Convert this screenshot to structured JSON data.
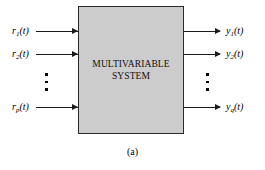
{
  "figure": {
    "caption": "(a)",
    "block": {
      "label_line1": "MULTIVARIABLE",
      "label_line2": "SYSTEM",
      "fill_color": "#cccccc",
      "border_color": "#2a2a2a"
    },
    "line_color": "#1a1a1a",
    "inputs": [
      {
        "label_base": "r",
        "label_sub": "1",
        "label_arg": "(t)"
      },
      {
        "label_base": "r",
        "label_sub": "2",
        "label_arg": "(t)"
      },
      {
        "label_base": "r",
        "label_sub": "p",
        "label_arg": "(t)"
      }
    ],
    "outputs": [
      {
        "label_base": "y",
        "label_sub": "1",
        "label_arg": "(t)"
      },
      {
        "label_base": "y",
        "label_sub": "2",
        "label_arg": "(t)"
      },
      {
        "label_base": "y",
        "label_sub": "q",
        "label_arg": "(t)"
      }
    ],
    "ellipsis": {
      "left_name": "input-vertical-ellipsis",
      "right_name": "output-vertical-ellipsis",
      "dot_count": 3
    }
  }
}
